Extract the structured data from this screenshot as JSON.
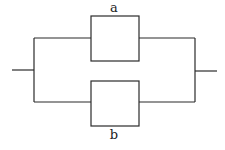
{
  "diagram": {
    "type": "parallel-circuit",
    "components": [
      {
        "id": "a",
        "label": "a",
        "position": "top"
      },
      {
        "id": "b",
        "label": "b",
        "position": "bottom"
      }
    ],
    "colors": {
      "line": "#2b2b2b",
      "background": "#ffffff"
    }
  }
}
